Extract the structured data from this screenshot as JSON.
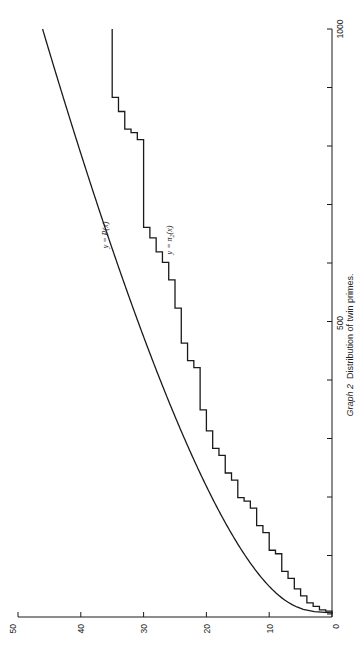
{
  "chart_data": {
    "type": "line",
    "orientation": "rotated 90 degrees counter-clockwise (x-axis vertical on right, y-axis horizontal along bottom)",
    "title": "",
    "caption": {
      "prefix": "Graph 2",
      "text": "Distribution of twin primes."
    },
    "xlabel": "",
    "ylabel": "",
    "xlim": [
      0,
      1000
    ],
    "ylim": [
      0,
      50
    ],
    "x_ticks": [
      0,
      100,
      200,
      300,
      400,
      500,
      600,
      700,
      800,
      900,
      1000
    ],
    "x_tick_labels": [
      "0",
      "",
      "",
      "",
      "",
      "500",
      "",
      "",
      "",
      "",
      "1000"
    ],
    "y_ticks": [
      0,
      10,
      20,
      30,
      40,
      50
    ],
    "y_tick_labels": [
      "0",
      "10",
      "20",
      "30",
      "40",
      "50"
    ],
    "grid": false,
    "legend": "none (inline curve labels)",
    "series": [
      {
        "name": "y = P(x)",
        "style": "smooth",
        "x": [
          2,
          10,
          25,
          50,
          75,
          100,
          150,
          200,
          250,
          300,
          350,
          400,
          450,
          500,
          550,
          600,
          650,
          700,
          750,
          800,
          850,
          900,
          950,
          1000
        ],
        "values": [
          0,
          2.6,
          4.5,
          6.6,
          8.2,
          9.6,
          12.0,
          14.1,
          16.1,
          18.0,
          19.8,
          21.5,
          23.1,
          24.7,
          26.2,
          27.7,
          29.2,
          30.6,
          32.0,
          33.4,
          34.8,
          36.1,
          37.4,
          38.7
        ]
      },
      {
        "name": "y = π₂(x)",
        "style": "step",
        "step_x": [
          5,
          7,
          13,
          19,
          31,
          43,
          61,
          73,
          103,
          109,
          139,
          151,
          181,
          193,
          199,
          229,
          241,
          271,
          283,
          313,
          349,
          421,
          433,
          463,
          523,
          571,
          601,
          619,
          643,
          661,
          811,
          823,
          829,
          859,
          883
        ],
        "values_at_steps": [
          1,
          2,
          3,
          4,
          5,
          6,
          7,
          8,
          9,
          10,
          11,
          12,
          13,
          14,
          15,
          16,
          17,
          18,
          19,
          20,
          21,
          22,
          23,
          24,
          25,
          26,
          27,
          28,
          29,
          30,
          31,
          32,
          33,
          34,
          35
        ],
        "final_value": 35
      }
    ],
    "annotations": [
      {
        "text": "y = P(x)",
        "near": "upper curve around x≈620"
      },
      {
        "text": "y = π₂(x)",
        "near": "step curve around x≈620"
      }
    ]
  },
  "labels": {
    "p_curve": "y = P(x)",
    "pi_curve_prefix": "y = π",
    "pi_curve_sub": "2",
    "pi_curve_suffix": "(x)",
    "caption_prefix": "Graph 2",
    "caption_text": "Distribution of twin primes.",
    "x_tick_0": "0",
    "x_tick_500": "500",
    "x_tick_1000": "1000",
    "y_tick_0": "0",
    "y_tick_10": "10",
    "y_tick_20": "20",
    "y_tick_30": "30",
    "y_tick_40": "40",
    "y_tick_50": "50"
  }
}
